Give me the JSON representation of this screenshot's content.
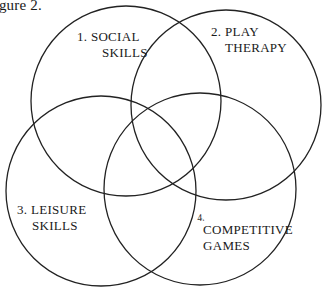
{
  "caption": "Figure 2.",
  "diagram": {
    "type": "venn",
    "circles": [
      {
        "id": 1,
        "line1": "1. SOCIAL",
        "line2": "SKILLS",
        "cx": 126,
        "cy": 101,
        "r": 95
      },
      {
        "id": 2,
        "line1": "2. PLAY",
        "line2": "THERAPY",
        "cx": 226,
        "cy": 105,
        "r": 95
      },
      {
        "id": 3,
        "line1": "3. LEISURE",
        "line2": "SKILLS",
        "cx": 101,
        "cy": 191,
        "r": 95
      },
      {
        "id": 4,
        "number": "4.",
        "line1": "COMPETITIVE",
        "line2": "GAMES",
        "cx": 200,
        "cy": 189,
        "r": 96
      }
    ],
    "stroke_color": "#222222"
  }
}
